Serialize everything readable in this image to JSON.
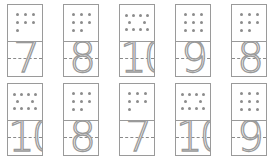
{
  "cards": [
    {
      "number": "7",
      "dots": 7
    },
    {
      "number": "8",
      "dots": 8
    },
    {
      "number": "10",
      "dots": 10
    },
    {
      "number": "9",
      "dots": 9
    },
    {
      "number": "8",
      "dots": 8
    },
    {
      "number": "10",
      "dots": 10
    },
    {
      "number": "8",
      "dots": 8
    },
    {
      "number": "7",
      "dots": 7
    },
    {
      "number": "10",
      "dots": 10
    },
    {
      "number": "9",
      "dots": 9
    }
  ],
  "colors": {
    "line": "#9a9a9a",
    "dot": "#8c8c8c"
  }
}
